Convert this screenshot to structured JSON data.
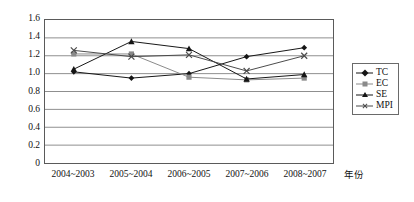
{
  "chart_data": {
    "type": "line",
    "title": "",
    "xlabel": "年份",
    "ylabel": "",
    "categories": [
      "2004~2003",
      "2005~2004",
      "2006~2005",
      "2007~2006",
      "2008~2007"
    ],
    "ylim": [
      0,
      1.6
    ],
    "yticks": [
      "0",
      "0.2",
      "0.4",
      "0.6",
      "0.8",
      "1.0",
      "1.2",
      "1.4",
      "1.6"
    ],
    "ytick_values": [
      0,
      0.2,
      0.4,
      0.6,
      0.8,
      1.0,
      1.2,
      1.4,
      1.6
    ],
    "grid": true,
    "legend_position": "right",
    "series": [
      {
        "name": "TC",
        "marker": "diamond",
        "color": "#151515",
        "values": [
          1.02,
          0.95,
          1.0,
          1.19,
          1.29
        ]
      },
      {
        "name": "EC",
        "marker": "square",
        "color": "#8a8a8a",
        "values": [
          1.22,
          1.22,
          0.96,
          0.93,
          0.95
        ]
      },
      {
        "name": "SE",
        "marker": "triangle",
        "color": "#151515",
        "values": [
          1.05,
          1.36,
          1.28,
          0.94,
          0.99
        ]
      },
      {
        "name": "MPI",
        "marker": "cross",
        "color": "#4a4a4a",
        "values": [
          1.26,
          1.19,
          1.21,
          1.03,
          1.2
        ]
      }
    ]
  }
}
